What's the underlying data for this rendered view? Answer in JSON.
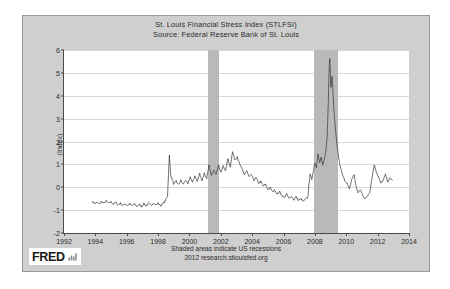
{
  "chart_card": {
    "title_lines": [
      "St. Louis Financial Stress Index (STLFSI)",
      "Source: Federal Reserve Bank of St. Louis"
    ],
    "footer_lines": [
      "Shaded areas indicate US recessions",
      "2012 research.stlouisfed.org"
    ],
    "logo": {
      "wordmark": "FRED",
      "mark_name": "bar-chart-icon"
    },
    "colors": {
      "card_background": "#cfcfcf",
      "plot_background": "#ffffff",
      "recession_band": "#b9b9b9",
      "series_line": "#333333",
      "gridline": "#d9d9d9",
      "axis": "#4a4a4a",
      "text": "#2b2b2b"
    }
  },
  "chart_data": {
    "type": "line",
    "title": "St. Louis Financial Stress Index (STLFSI)",
    "subtitle": "Source: Federal Reserve Bank of St. Louis",
    "xlabel": "",
    "ylabel": "(Index)",
    "xlim": [
      1992,
      2014
    ],
    "ylim": [
      -2,
      6
    ],
    "grid": true,
    "legend": null,
    "xticks": [
      1992,
      1994,
      1996,
      1998,
      2000,
      2002,
      2004,
      2006,
      2008,
      2010,
      2012,
      2014
    ],
    "yticks": [
      -2,
      -1,
      0,
      1,
      2,
      3,
      4,
      5,
      6
    ],
    "annotations": [
      "Shaded areas indicate US recessions",
      "2012 research.stlouisfed.org"
    ],
    "shaded_regions": [
      {
        "label": "2001 recession",
        "x0": 2001.2,
        "x1": 2001.9
      },
      {
        "label": "2007-2009 recession",
        "x0": 2007.95,
        "x1": 2009.5
      }
    ],
    "series": [
      {
        "name": "STLFSI",
        "x": [
          1993.8,
          1993.95,
          1994.1,
          1994.25,
          1994.4,
          1994.55,
          1994.7,
          1994.85,
          1995.0,
          1995.15,
          1995.3,
          1995.45,
          1995.6,
          1995.75,
          1995.9,
          1996.05,
          1996.2,
          1996.35,
          1996.5,
          1996.65,
          1996.8,
          1996.95,
          1997.1,
          1997.25,
          1997.4,
          1997.55,
          1997.7,
          1997.85,
          1998.0,
          1998.15,
          1998.3,
          1998.45,
          1998.6,
          1998.72,
          1998.8,
          1998.9,
          1999.0,
          1999.15,
          1999.3,
          1999.45,
          1999.6,
          1999.75,
          1999.9,
          2000.05,
          2000.2,
          2000.35,
          2000.5,
          2000.65,
          2000.8,
          2000.95,
          2001.1,
          2001.25,
          2001.4,
          2001.55,
          2001.7,
          2001.85,
          2002.0,
          2002.15,
          2002.3,
          2002.45,
          2002.6,
          2002.75,
          2002.9,
          2003.05,
          2003.2,
          2003.35,
          2003.5,
          2003.65,
          2003.8,
          2003.95,
          2004.1,
          2004.25,
          2004.4,
          2004.55,
          2004.7,
          2004.85,
          2005.0,
          2005.15,
          2005.3,
          2005.45,
          2005.6,
          2005.75,
          2005.9,
          2006.05,
          2006.2,
          2006.35,
          2006.5,
          2006.65,
          2006.8,
          2006.95,
          2007.1,
          2007.25,
          2007.4,
          2007.55,
          2007.62,
          2007.7,
          2007.8,
          2007.9,
          2008.0,
          2008.1,
          2008.2,
          2008.3,
          2008.4,
          2008.5,
          2008.6,
          2008.7,
          2008.78,
          2008.85,
          2008.9,
          2008.95,
          2009.02,
          2009.1,
          2009.2,
          2009.3,
          2009.4,
          2009.5,
          2009.6,
          2009.75,
          2009.9,
          2010.05,
          2010.2,
          2010.35,
          2010.5,
          2010.62,
          2010.75,
          2010.9,
          2011.05,
          2011.2,
          2011.35,
          2011.5,
          2011.65,
          2011.78,
          2011.9,
          2012.05,
          2012.2,
          2012.35,
          2012.5,
          2012.65,
          2012.8,
          2012.95
        ],
        "y": [
          -0.62,
          -0.72,
          -0.66,
          -0.74,
          -0.62,
          -0.7,
          -0.6,
          -0.7,
          -0.64,
          -0.74,
          -0.66,
          -0.78,
          -0.7,
          -0.8,
          -0.72,
          -0.8,
          -0.72,
          -0.82,
          -0.74,
          -0.84,
          -0.76,
          -0.84,
          -0.72,
          -0.82,
          -0.7,
          -0.8,
          -0.68,
          -0.78,
          -0.7,
          -0.8,
          -0.72,
          -0.6,
          -0.4,
          1.42,
          0.55,
          0.35,
          0.1,
          0.28,
          0.1,
          0.3,
          0.12,
          0.32,
          0.14,
          0.45,
          0.2,
          0.5,
          0.25,
          0.6,
          0.3,
          0.62,
          0.35,
          0.95,
          0.5,
          0.78,
          0.55,
          1.0,
          0.62,
          0.95,
          0.7,
          1.25,
          0.9,
          1.55,
          1.2,
          1.35,
          1.0,
          0.8,
          0.55,
          0.72,
          0.45,
          0.55,
          0.3,
          0.42,
          0.18,
          0.25,
          0.05,
          0.12,
          -0.1,
          -0.02,
          -0.2,
          -0.12,
          -0.3,
          -0.2,
          -0.35,
          -0.45,
          -0.3,
          -0.5,
          -0.38,
          -0.55,
          -0.42,
          -0.58,
          -0.5,
          -0.62,
          -0.52,
          -0.45,
          0.15,
          0.55,
          0.35,
          0.7,
          1.1,
          0.85,
          1.45,
          1.05,
          1.3,
          0.95,
          1.25,
          1.6,
          2.2,
          3.6,
          5.05,
          5.62,
          4.4,
          4.85,
          3.5,
          2.6,
          1.9,
          1.35,
          0.95,
          0.55,
          0.3,
          0.18,
          -0.1,
          0.35,
          0.55,
          0.05,
          -0.25,
          -0.1,
          -0.35,
          -0.5,
          -0.38,
          -0.2,
          0.45,
          1.0,
          0.72,
          0.45,
          0.18,
          0.3,
          0.55,
          0.25,
          0.4,
          0.3
        ]
      }
    ]
  }
}
